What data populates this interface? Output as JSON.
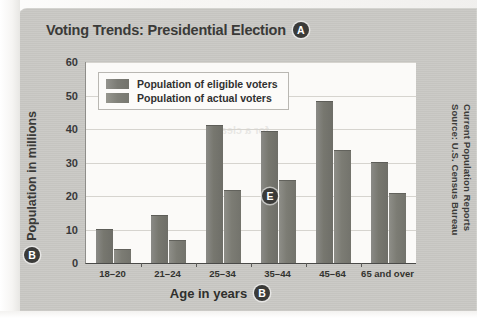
{
  "chart_title": "Voting Trends: Presidential Election",
  "markers": {
    "title_marker": "A",
    "yaxis_marker": "B",
    "xaxis_marker": "B",
    "plot_marker": "E"
  },
  "source": {
    "line1": "Source: U.S. Census Bureau",
    "line2": "Current Population Reports"
  },
  "ghost_text": {
    "l1": "a sensible decision",
    "l2": "to question the",
    "l3": "for a clearer"
  },
  "chart_data": {
    "type": "bar",
    "title": "Voting Trends: Presidential Election",
    "xlabel": "Age in years",
    "ylabel": "Population in millions",
    "categories": [
      "18–20",
      "21–24",
      "25–34",
      "35–44",
      "45–64",
      "65 and over"
    ],
    "series": [
      {
        "name": "Population of eligible voters",
        "values": [
          10,
          14,
          41,
          39,
          48,
          30
        ],
        "color": "#77776f"
      },
      {
        "name": "Population of actual voters",
        "values": [
          4,
          6.5,
          21.5,
          24.5,
          33.5,
          20.5
        ],
        "color": "#7c7c74"
      }
    ],
    "ylim": [
      0,
      60
    ],
    "yticks": [
      0,
      10,
      20,
      30,
      40,
      50,
      60
    ],
    "grid": true,
    "legend_position": "top-left-inside"
  }
}
